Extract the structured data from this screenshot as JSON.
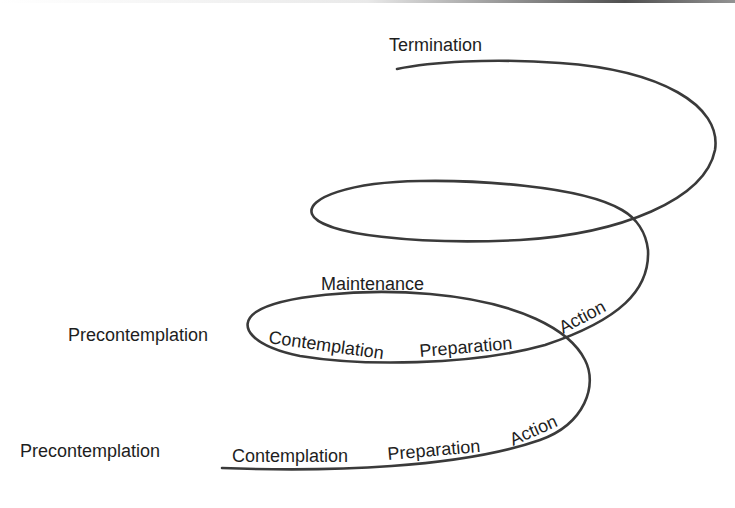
{
  "diagram": {
    "colors": {
      "line": "#3a3a3a",
      "text": "#1e1e1e",
      "background": "#ffffff"
    },
    "labels": {
      "termination": "Termination",
      "maintenance": "Maintenance",
      "upper_cycle": {
        "precontemplation": "Precontemplation",
        "contemplation": "Contemplation",
        "preparation": "Preparation",
        "action": "Action"
      },
      "lower_cycle": {
        "precontemplation": "Precontemplation",
        "contemplation": "Contemplation",
        "preparation": "Preparation",
        "action": "Action"
      }
    }
  }
}
